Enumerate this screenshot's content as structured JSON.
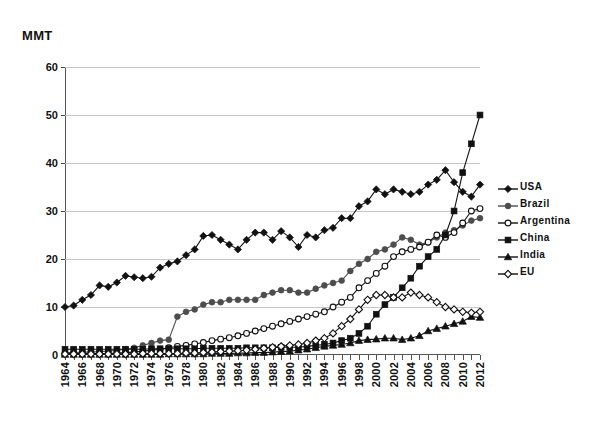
{
  "axis": {
    "y_unit_label": "MMT",
    "y_ticks": [
      "0",
      "10",
      "20",
      "30",
      "40",
      "50",
      "60"
    ],
    "x_ticks": [
      "1964",
      "1966",
      "1968",
      "1970",
      "1972",
      "1974",
      "1976",
      "1978",
      "1980",
      "1982",
      "1984",
      "1986",
      "1988",
      "1990",
      "1992",
      "1994",
      "1996",
      "1998",
      "2000",
      "2002",
      "2004",
      "2006",
      "2008",
      "2010",
      "2012"
    ]
  },
  "legend": {
    "position": "right",
    "items": [
      {
        "label": "USA",
        "marker": "filled-diamond",
        "color": "#111111"
      },
      {
        "label": "Brazil",
        "marker": "filled-circle",
        "color": "#4d4d4d"
      },
      {
        "label": "Argentina",
        "marker": "open-circle",
        "color": "#111111"
      },
      {
        "label": "China",
        "marker": "filled-square",
        "color": "#111111"
      },
      {
        "label": "India",
        "marker": "filled-triangle",
        "color": "#111111"
      },
      {
        "label": "EU",
        "marker": "open-diamond",
        "color": "#111111"
      }
    ]
  },
  "chart_data": {
    "type": "line",
    "title": "",
    "xlabel": "",
    "ylabel": "MMT",
    "ylim": [
      0,
      60
    ],
    "grid": true,
    "legend_position": "right",
    "x": [
      1964,
      1965,
      1966,
      1967,
      1968,
      1969,
      1970,
      1971,
      1972,
      1973,
      1974,
      1975,
      1976,
      1977,
      1978,
      1979,
      1980,
      1981,
      1982,
      1983,
      1984,
      1985,
      1986,
      1987,
      1988,
      1989,
      1990,
      1991,
      1992,
      1993,
      1994,
      1995,
      1996,
      1997,
      1998,
      1999,
      2000,
      2001,
      2002,
      2003,
      2004,
      2005,
      2006,
      2007,
      2008,
      2009,
      2010,
      2011,
      2012
    ],
    "series": [
      {
        "name": "USA",
        "marker": "filled-diamond",
        "color": "#111111",
        "values": [
          10.0,
          10.3,
          11.5,
          12.5,
          14.5,
          14.2,
          15.1,
          16.5,
          16.2,
          16.0,
          16.3,
          18.2,
          19.0,
          19.5,
          20.8,
          22.0,
          24.8,
          25.0,
          24.0,
          23.0,
          22.0,
          24.0,
          25.5,
          25.5,
          24.0,
          25.8,
          24.5,
          22.5,
          25.0,
          24.5,
          26.0,
          26.5,
          28.5,
          28.5,
          31.0,
          32.0,
          34.5,
          33.5,
          34.5,
          34.0,
          33.5,
          34.0,
          35.5,
          36.5,
          38.5,
          36.0,
          34.0,
          33.0,
          35.5
        ]
      },
      {
        "name": "Brazil",
        "marker": "filled-circle",
        "color": "#4d4d4d",
        "values": [
          0.5,
          0.5,
          0.6,
          0.6,
          0.7,
          0.8,
          1.0,
          1.2,
          1.5,
          2.0,
          2.5,
          3.0,
          3.2,
          8.0,
          9.0,
          9.5,
          10.5,
          11.0,
          11.0,
          11.5,
          11.5,
          11.5,
          11.5,
          12.5,
          13.0,
          13.5,
          13.5,
          13.0,
          13.0,
          13.8,
          14.5,
          15.0,
          15.5,
          17.5,
          19.0,
          20.0,
          21.5,
          22.0,
          23.0,
          24.5,
          24.0,
          23.0,
          23.5,
          24.5,
          25.5,
          26.0,
          27.0,
          28.0,
          28.5
        ]
      },
      {
        "name": "Argentina",
        "marker": "open-circle",
        "color": "#111111",
        "values": [
          0.3,
          0.3,
          0.3,
          0.3,
          0.3,
          0.3,
          0.4,
          0.5,
          0.6,
          0.8,
          1.0,
          1.2,
          1.5,
          1.8,
          2.0,
          2.3,
          2.6,
          3.0,
          3.3,
          3.6,
          4.0,
          4.5,
          5.0,
          5.5,
          6.0,
          6.5,
          7.0,
          7.5,
          8.0,
          8.5,
          9.0,
          10.0,
          11.0,
          12.0,
          14.0,
          15.5,
          17.0,
          18.5,
          20.5,
          21.5,
          22.0,
          22.5,
          23.5,
          25.0,
          24.5,
          25.5,
          27.5,
          30.0,
          30.5
        ]
      },
      {
        "name": "China",
        "marker": "filled-square",
        "color": "#111111",
        "values": [
          1.2,
          1.2,
          1.2,
          1.2,
          1.2,
          1.2,
          1.2,
          1.2,
          1.2,
          1.2,
          1.3,
          1.3,
          1.3,
          1.3,
          1.3,
          1.3,
          1.4,
          1.4,
          1.4,
          1.4,
          1.4,
          1.5,
          1.5,
          1.5,
          1.5,
          1.6,
          1.6,
          1.6,
          1.8,
          2.0,
          2.2,
          2.5,
          3.0,
          3.5,
          4.5,
          6.0,
          8.5,
          10.5,
          12.0,
          14.0,
          16.0,
          18.5,
          20.5,
          22.0,
          25.0,
          30.0,
          38.0,
          44.0,
          50.0
        ]
      },
      {
        "name": "India",
        "marker": "filled-triangle",
        "color": "#111111",
        "values": [
          0.1,
          0.1,
          0.1,
          0.1,
          0.1,
          0.1,
          0.1,
          0.1,
          0.1,
          0.1,
          0.1,
          0.1,
          0.2,
          0.2,
          0.2,
          0.2,
          0.2,
          0.3,
          0.3,
          0.3,
          0.4,
          0.4,
          0.5,
          0.5,
          0.6,
          0.7,
          0.8,
          1.0,
          1.2,
          1.5,
          1.8,
          2.0,
          2.2,
          2.5,
          3.0,
          3.2,
          3.3,
          3.5,
          3.5,
          3.2,
          3.5,
          4.0,
          5.0,
          5.5,
          6.0,
          6.5,
          7.0,
          8.0,
          7.8
        ]
      },
      {
        "name": "EU",
        "marker": "open-diamond",
        "color": "#111111",
        "values": [
          0.2,
          0.2,
          0.2,
          0.2,
          0.2,
          0.2,
          0.2,
          0.2,
          0.2,
          0.3,
          0.3,
          0.3,
          0.3,
          0.3,
          0.4,
          0.4,
          0.5,
          0.6,
          0.7,
          0.8,
          0.9,
          1.0,
          1.2,
          1.4,
          1.6,
          1.8,
          2.0,
          2.2,
          2.5,
          3.0,
          3.5,
          4.5,
          6.0,
          7.5,
          9.5,
          11.5,
          12.5,
          12.5,
          12.0,
          12.0,
          13.0,
          12.5,
          12.0,
          11.0,
          10.0,
          9.5,
          9.0,
          8.8,
          9.0
        ]
      }
    ]
  }
}
